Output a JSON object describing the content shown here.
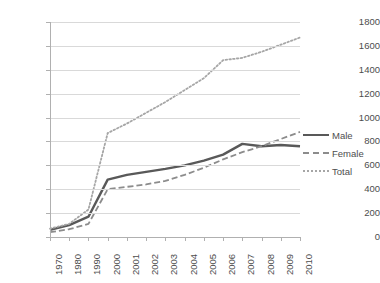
{
  "chart_data": {
    "type": "line",
    "title": "",
    "xlabel": "",
    "ylabel": "",
    "ylim": [
      0,
      1800
    ],
    "ytick_step": 200,
    "grid": true,
    "legend_position": "right",
    "categories": [
      "1970",
      "1980",
      "1990",
      "2000",
      "2001",
      "2002",
      "2003",
      "2004",
      "2005",
      "2006",
      "2007",
      "2008",
      "2009",
      "2010"
    ],
    "ytick_labels": [
      "1800",
      "1600",
      "1400",
      "1200",
      "1000",
      "800",
      "600",
      "400",
      "200",
      "0"
    ],
    "series": [
      {
        "name": "Male",
        "style": "solid",
        "color": "#595959",
        "values": [
          60,
          100,
          170,
          480,
          520,
          545,
          570,
          600,
          640,
          690,
          780,
          760,
          770,
          760
        ]
      },
      {
        "name": "Female",
        "style": "dashed",
        "color": "#8c8c8c",
        "values": [
          40,
          65,
          110,
          400,
          420,
          440,
          470,
          520,
          580,
          650,
          710,
          760,
          820,
          880
        ]
      },
      {
        "name": "Total",
        "style": "dotted",
        "color": "#a6a6a6",
        "values": [
          70,
          110,
          230,
          870,
          950,
          1040,
          1130,
          1230,
          1330,
          1480,
          1500,
          1550,
          1610,
          1670
        ]
      }
    ]
  }
}
